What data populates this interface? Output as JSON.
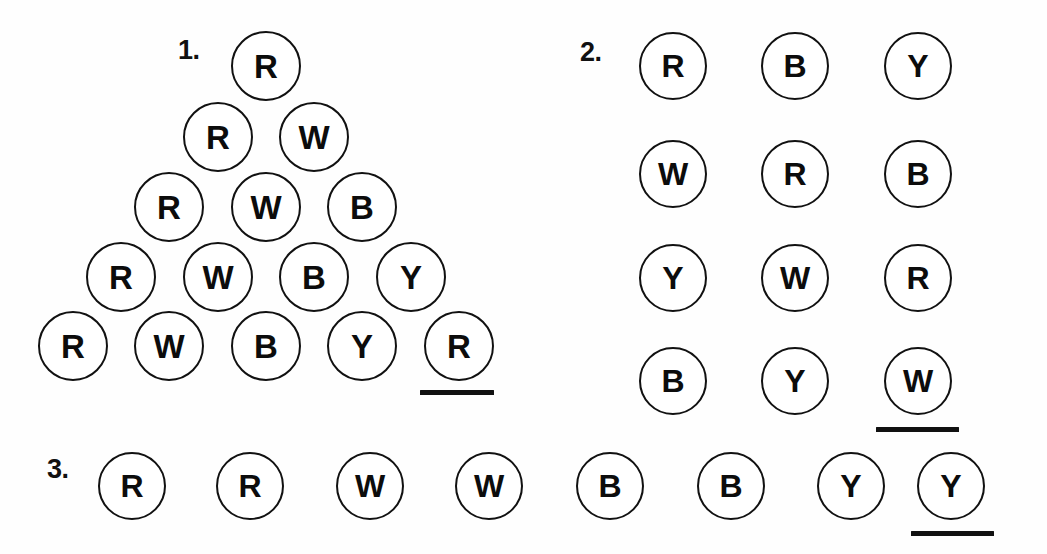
{
  "page": {
    "background_color": "#fefefe",
    "ink_color": "#111111",
    "width": 1047,
    "height": 554
  },
  "legend": {
    "R": "Red",
    "W": "White",
    "B": "Blue",
    "Y": "Yellow"
  },
  "problems": [
    {
      "id": "problem-1",
      "number_label": "1.",
      "layout": "triangle",
      "rows": [
        {
          "tokens": [
            "R"
          ]
        },
        {
          "tokens": [
            "R",
            "W"
          ]
        },
        {
          "tokens": [
            "R",
            "W",
            "B"
          ]
        },
        {
          "tokens": [
            "R",
            "W",
            "B",
            "Y"
          ]
        },
        {
          "tokens": [
            "R",
            "W",
            "B",
            "Y",
            "R"
          ]
        }
      ],
      "answer_blank": {
        "under_token": "R",
        "row": 5,
        "position": 5
      }
    },
    {
      "id": "problem-2",
      "number_label": "2.",
      "layout": "grid",
      "columns": 3,
      "rows": [
        {
          "tokens": [
            "R",
            "B",
            "Y"
          ]
        },
        {
          "tokens": [
            "W",
            "R",
            "B"
          ]
        },
        {
          "tokens": [
            "Y",
            "W",
            "R"
          ]
        },
        {
          "tokens": [
            "B",
            "Y",
            "W"
          ]
        }
      ],
      "answer_blank": {
        "under_token": "W",
        "row": 4,
        "position": 3
      }
    },
    {
      "id": "problem-3",
      "number_label": "3.",
      "layout": "row",
      "rows": [
        {
          "tokens": [
            "R",
            "R",
            "W",
            "W",
            "B",
            "B",
            "Y",
            "Y"
          ]
        }
      ],
      "answer_blank": {
        "under_token": "Y",
        "row": 1,
        "position": 8
      }
    }
  ]
}
